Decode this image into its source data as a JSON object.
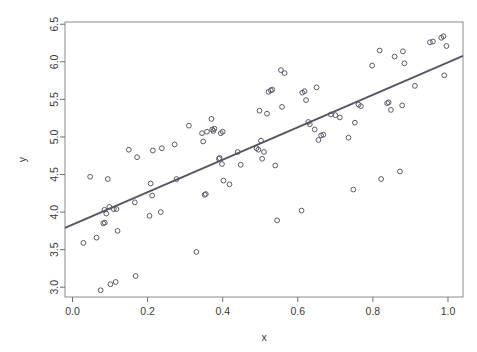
{
  "figure": {
    "background": "#ffffff",
    "frame_color": "#8a8a8a",
    "point_color": "#5a5a66",
    "line_color": "#555560",
    "top_clipped_text": ""
  },
  "chart_data": {
    "type": "scatter",
    "title": "",
    "xlabel": "x",
    "ylabel": "y",
    "xlim": [
      -0.02,
      1.04
    ],
    "ylim": [
      2.87,
      6.53
    ],
    "xticks": [
      0.0,
      0.2,
      0.4,
      0.6,
      0.8,
      1.0
    ],
    "xticklabels": [
      "0.0",
      "0.2",
      "0.4",
      "0.6",
      "0.8",
      "1.0"
    ],
    "yticks": [
      3.0,
      3.5,
      4.0,
      4.5,
      5.0,
      5.5,
      6.0,
      6.5
    ],
    "yticklabels": [
      "3.0",
      "3.5",
      "4.0",
      "4.5",
      "5.0",
      "5.5",
      "6.0",
      "6.5"
    ],
    "grid": false,
    "legend": null,
    "marker": "open-circle",
    "fit_line": {
      "type": "linear-regression",
      "x_endpoints": [
        -0.02,
        1.04
      ],
      "y_endpoints": [
        3.79,
        6.08
      ],
      "slope": 2.16,
      "intercept": 3.83
    },
    "points": [
      [
        0.029,
        3.59
      ],
      [
        0.047,
        4.47
      ],
      [
        0.064,
        3.66
      ],
      [
        0.075,
        2.96
      ],
      [
        0.082,
        3.85
      ],
      [
        0.085,
        4.03
      ],
      [
        0.086,
        3.86
      ],
      [
        0.09,
        3.98
      ],
      [
        0.094,
        4.44
      ],
      [
        0.098,
        4.07
      ],
      [
        0.101,
        3.04
      ],
      [
        0.11,
        4.04
      ],
      [
        0.115,
        3.07
      ],
      [
        0.117,
        4.04
      ],
      [
        0.12,
        3.75
      ],
      [
        0.15,
        4.83
      ],
      [
        0.166,
        4.13
      ],
      [
        0.168,
        3.15
      ],
      [
        0.172,
        4.73
      ],
      [
        0.205,
        3.95
      ],
      [
        0.208,
        4.38
      ],
      [
        0.212,
        4.22
      ],
      [
        0.214,
        4.82
      ],
      [
        0.235,
        4.0
      ],
      [
        0.238,
        4.85
      ],
      [
        0.272,
        4.9
      ],
      [
        0.277,
        4.44
      ],
      [
        0.31,
        5.15
      ],
      [
        0.33,
        3.47
      ],
      [
        0.345,
        5.05
      ],
      [
        0.348,
        4.94
      ],
      [
        0.352,
        4.23
      ],
      [
        0.355,
        4.24
      ],
      [
        0.358,
        5.07
      ],
      [
        0.37,
        5.24
      ],
      [
        0.372,
        5.1
      ],
      [
        0.375,
        5.08
      ],
      [
        0.378,
        5.11
      ],
      [
        0.39,
        4.71
      ],
      [
        0.392,
        4.72
      ],
      [
        0.395,
        5.05
      ],
      [
        0.398,
        4.64
      ],
      [
        0.4,
        5.07
      ],
      [
        0.402,
        4.42
      ],
      [
        0.418,
        4.37
      ],
      [
        0.44,
        4.8
      ],
      [
        0.448,
        4.63
      ],
      [
        0.49,
        4.85
      ],
      [
        0.495,
        4.83
      ],
      [
        0.498,
        5.35
      ],
      [
        0.502,
        4.95
      ],
      [
        0.505,
        4.71
      ],
      [
        0.51,
        4.8
      ],
      [
        0.518,
        5.31
      ],
      [
        0.522,
        5.6
      ],
      [
        0.528,
        5.62
      ],
      [
        0.532,
        5.63
      ],
      [
        0.54,
        4.62
      ],
      [
        0.545,
        3.89
      ],
      [
        0.555,
        5.89
      ],
      [
        0.558,
        5.4
      ],
      [
        0.565,
        5.85
      ],
      [
        0.61,
        4.02
      ],
      [
        0.612,
        5.59
      ],
      [
        0.618,
        5.61
      ],
      [
        0.622,
        5.49
      ],
      [
        0.628,
        5.2
      ],
      [
        0.632,
        5.17
      ],
      [
        0.645,
        5.1
      ],
      [
        0.65,
        5.66
      ],
      [
        0.655,
        4.96
      ],
      [
        0.662,
        5.02
      ],
      [
        0.668,
        5.03
      ],
      [
        0.688,
        5.3
      ],
      [
        0.7,
        5.29
      ],
      [
        0.712,
        5.26
      ],
      [
        0.735,
        4.99
      ],
      [
        0.748,
        4.3
      ],
      [
        0.752,
        5.19
      ],
      [
        0.762,
        5.43
      ],
      [
        0.768,
        5.41
      ],
      [
        0.798,
        5.95
      ],
      [
        0.818,
        6.15
      ],
      [
        0.822,
        4.44
      ],
      [
        0.838,
        5.45
      ],
      [
        0.842,
        5.46
      ],
      [
        0.848,
        5.36
      ],
      [
        0.858,
        6.07
      ],
      [
        0.872,
        4.54
      ],
      [
        0.878,
        5.42
      ],
      [
        0.88,
        6.14
      ],
      [
        0.884,
        5.98
      ],
      [
        0.912,
        5.68
      ],
      [
        0.952,
        6.26
      ],
      [
        0.96,
        6.27
      ],
      [
        0.982,
        6.32
      ],
      [
        0.988,
        6.34
      ],
      [
        0.99,
        5.82
      ],
      [
        0.996,
        6.21
      ]
    ]
  }
}
